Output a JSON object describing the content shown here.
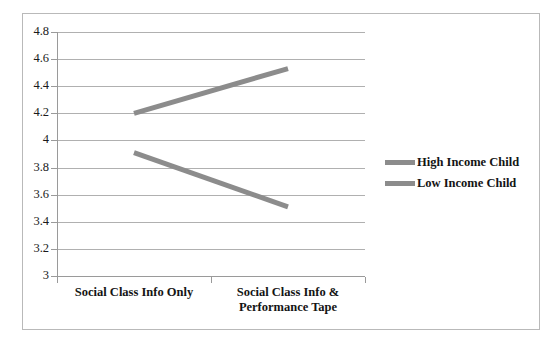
{
  "chart_data": {
    "type": "line",
    "title": "",
    "subtitle": "",
    "xlabel": "",
    "ylabel": "",
    "categories": [
      "Social Class Info Only",
      "Social Class Info & Performance Tape"
    ],
    "category_lines": [
      [
        "Social Class Info Only"
      ],
      [
        "Social Class Info &",
        "Performance Tape"
      ]
    ],
    "series": [
      {
        "name": "High Income Child",
        "values": [
          4.2,
          4.53
        ],
        "color": "#8c8c8c"
      },
      {
        "name": "Low Income Child",
        "values": [
          3.91,
          3.51
        ],
        "color": "#8c8c8c"
      }
    ],
    "ylim": [
      3,
      4.8
    ],
    "ytick_step": 0.2,
    "ytick_labels": [
      "4.8",
      "4.6",
      "4.4",
      "4.2",
      "4",
      "3.8",
      "3.6",
      "3.4",
      "3.2",
      "3"
    ],
    "ytick_values": [
      4.8,
      4.6,
      4.4,
      4.2,
      4.0,
      3.8,
      3.6,
      3.4,
      3.2,
      3.0
    ],
    "grid": true,
    "legend_position": "right",
    "legend_entries": [
      "High Income Child",
      "Low Income Child"
    ],
    "line_width": 5,
    "colors": {
      "line": "#8c8c8c",
      "grid": "#b0b0b0",
      "axis": "#9a9a9a",
      "frame": "#b9b9b9",
      "text": "#141414",
      "background": "#ffffff"
    }
  }
}
